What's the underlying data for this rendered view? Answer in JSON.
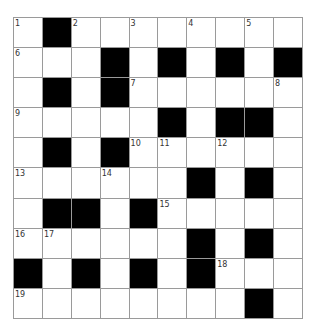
{
  "puzzle": {
    "title": "",
    "rows": 10,
    "cols": 10,
    "colors": {
      "block": "#000000",
      "open": "#ffffff",
      "gridline": "#9a9a9a",
      "number": "#333333"
    },
    "grid": [
      [
        "1",
        "#",
        "2",
        ".",
        "3",
        ".",
        "4",
        ".",
        "5",
        "."
      ],
      [
        "6",
        ".",
        ".",
        "#",
        ".",
        "#",
        ".",
        "#",
        ".",
        "#"
      ],
      [
        ".",
        "#",
        ".",
        "#",
        "7",
        ".",
        ".",
        ".",
        ".",
        "8"
      ],
      [
        "9",
        ".",
        ".",
        ".",
        ".",
        "#",
        ".",
        "#",
        "#",
        "."
      ],
      [
        ".",
        "#",
        ".",
        "#",
        "10",
        "11",
        ".",
        "12",
        ".",
        "."
      ],
      [
        "13",
        ".",
        ".",
        "14",
        ".",
        ".",
        "#",
        ".",
        "#",
        "."
      ],
      [
        ".",
        "#",
        "#",
        ".",
        "#",
        "15",
        ".",
        ".",
        ".",
        "."
      ],
      [
        "16",
        "17",
        ".",
        ".",
        ".",
        ".",
        "#",
        ".",
        "#",
        "."
      ],
      [
        "#",
        ".",
        "#",
        ".",
        "#",
        ".",
        "#",
        "18",
        ".",
        "."
      ],
      [
        "19",
        ".",
        ".",
        ".",
        ".",
        ".",
        ".",
        ".",
        "#",
        "."
      ]
    ],
    "letters": []
  }
}
